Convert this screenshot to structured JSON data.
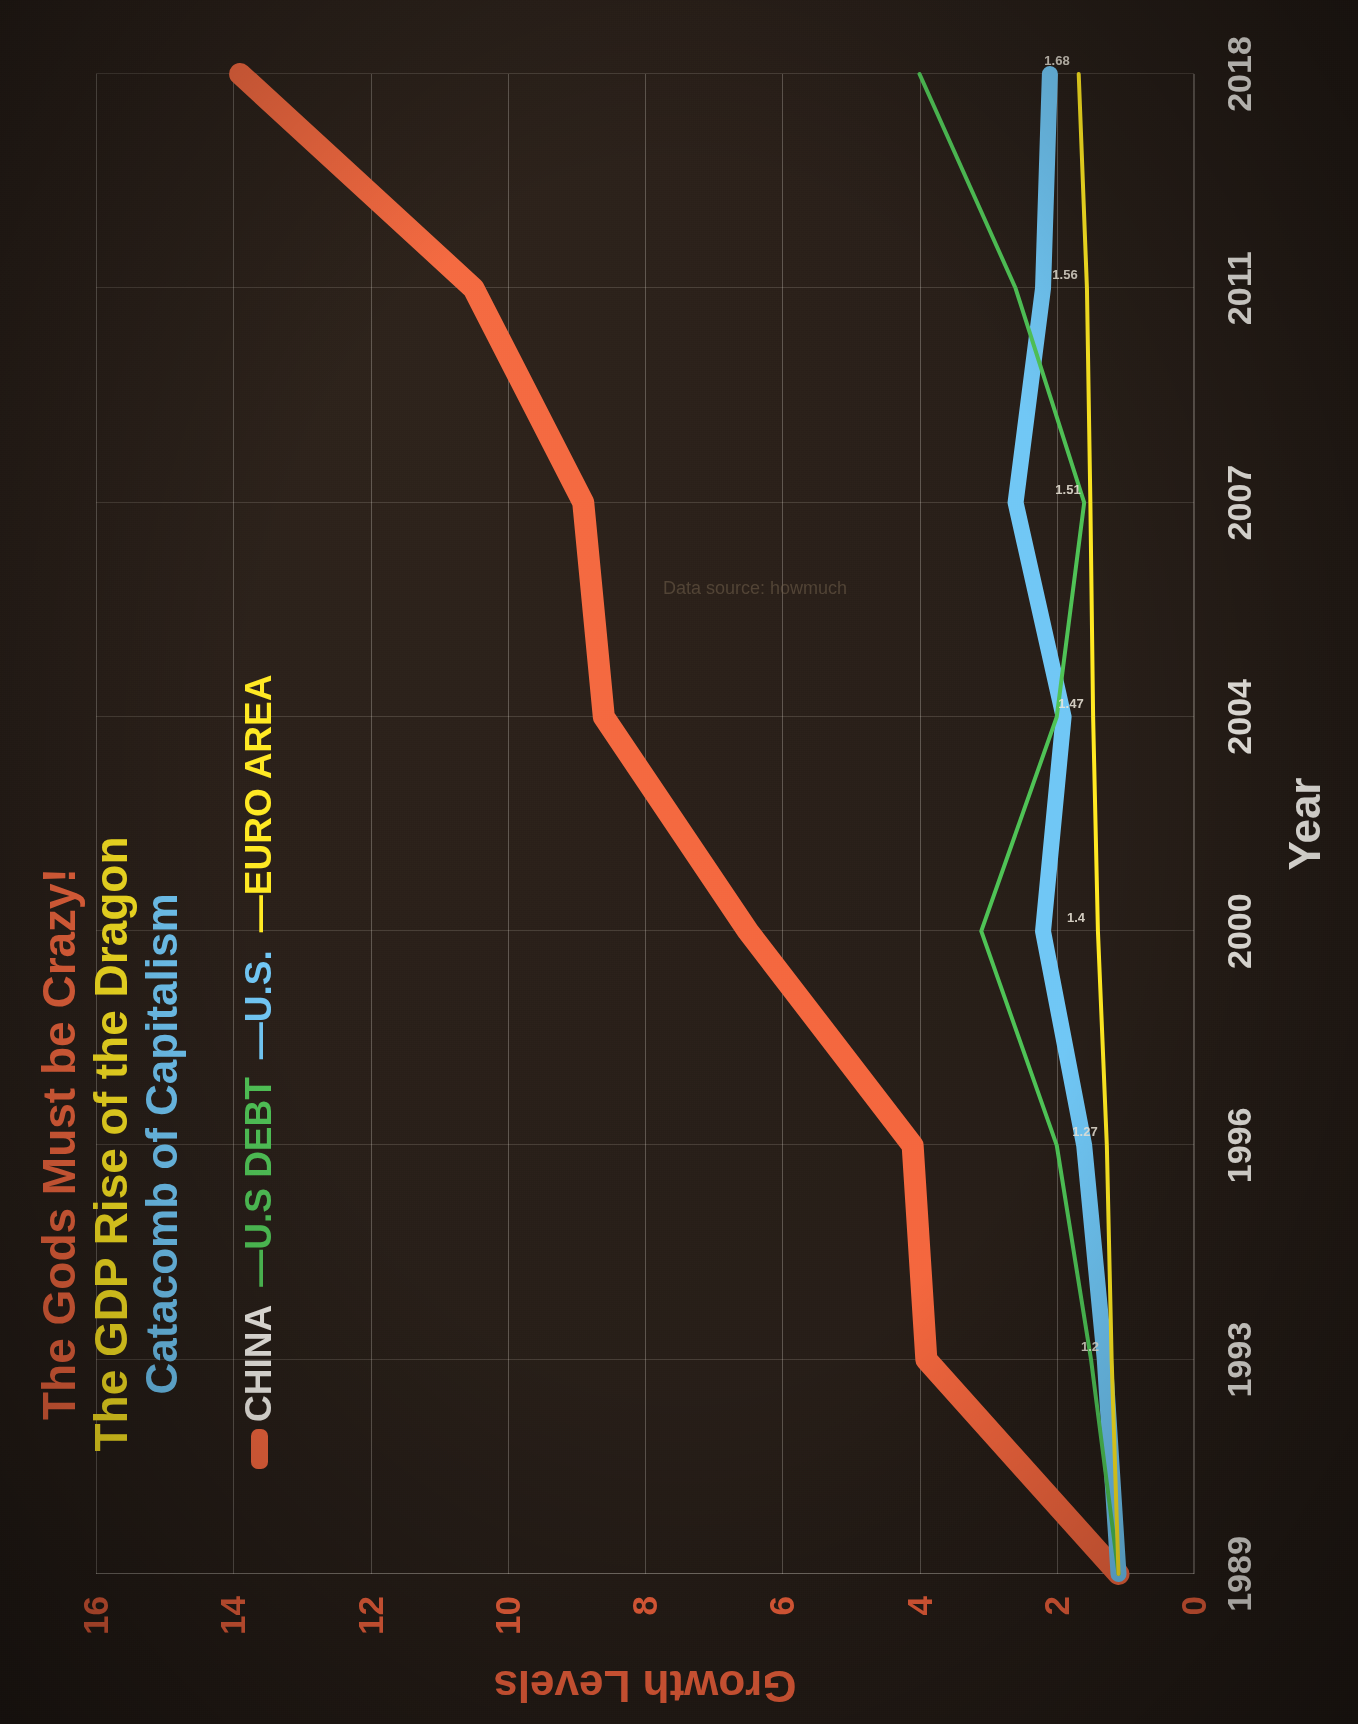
{
  "titles": {
    "line1": "The Gods Must be Crazy!",
    "line2": "The GDP Rise of the Dragon",
    "line3": "Catacomb of Capitalism",
    "color1": "#f4653c",
    "color2": "#ffe81f",
    "color3": "#6ec6f5"
  },
  "watermark": "Data source: howmuch",
  "legend": {
    "items": [
      {
        "label": "CHINA",
        "color": "#f4653c",
        "text_color": "#f2efe9"
      },
      {
        "label": "—U.S DEBT",
        "color": "#4cc254",
        "text_color": "#4cc254"
      },
      {
        "label": "—U.S.",
        "color": "#6ec6f5",
        "text_color": "#6ec6f5"
      },
      {
        "label": "—EURO AREA",
        "color": "#ffe81f",
        "text_color": "#ffe81f"
      }
    ]
  },
  "axes": {
    "x_label": "Year",
    "y_label": "Growth Levels",
    "y_ticks": [
      "0",
      "2",
      "4",
      "6",
      "8",
      "10",
      "12",
      "14",
      "16"
    ],
    "x_ticks": [
      "1989",
      "1993",
      "1996",
      "2000",
      "2004",
      "2007",
      "2011",
      "2018"
    ]
  },
  "chart_data": {
    "type": "line",
    "xlabel": "Year",
    "ylabel": "Growth Levels",
    "categories": [
      "1989",
      "1993",
      "1996",
      "2000",
      "2004",
      "2007",
      "2011",
      "2018"
    ],
    "ylim": [
      0,
      16
    ],
    "xlim": [
      0,
      7
    ],
    "grid": true,
    "legend_position": "top-left",
    "series": [
      {
        "name": "CHINA",
        "color": "#f4653c",
        "width": 22,
        "values": [
          1.1,
          3.9,
          4.1,
          6.5,
          8.6,
          8.9,
          10.5,
          13.9
        ]
      },
      {
        "name": "U.S DEBT",
        "color": "#4cc254",
        "width": 4,
        "values": [
          1.1,
          1.5,
          2.0,
          3.1,
          2.0,
          1.6,
          2.6,
          4.0
        ]
      },
      {
        "name": "U.S.",
        "color": "#6ec6f5",
        "width": 16,
        "values": [
          1.1,
          1.3,
          1.6,
          2.2,
          1.9,
          2.6,
          2.2,
          2.1
        ]
      },
      {
        "name": "EURO AREA",
        "color": "#ffe81f",
        "width": 4,
        "values": [
          1.1,
          1.2,
          1.27,
          1.4,
          1.47,
          1.51,
          1.56,
          1.68
        ]
      }
    ],
    "data_labels": [
      {
        "series": "EURO AREA",
        "x": 1,
        "y": 1.2,
        "text": "1.2"
      },
      {
        "series": "EURO AREA",
        "x": 2,
        "y": 1.27,
        "text": "1.27"
      },
      {
        "series": "EURO AREA",
        "x": 3,
        "y": 1.4,
        "text": "1.4"
      },
      {
        "series": "EURO AREA",
        "x": 4,
        "y": 1.47,
        "text": "1.47"
      },
      {
        "series": "EURO AREA",
        "x": 5,
        "y": 1.51,
        "text": "1.51"
      },
      {
        "series": "EURO AREA",
        "x": 6,
        "y": 1.56,
        "text": "1.56"
      },
      {
        "series": "EURO AREA",
        "x": 7,
        "y": 1.68,
        "text": "1.68"
      }
    ]
  }
}
